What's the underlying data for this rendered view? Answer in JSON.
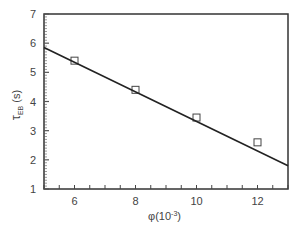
{
  "chart_data": {
    "type": "scatter",
    "title": "",
    "xlabel": "φ (10⁻³)",
    "ylabel": "τEB (s)",
    "xlim": [
      5,
      13
    ],
    "ylim": [
      1,
      7
    ],
    "xticks": [
      6,
      8,
      10,
      12
    ],
    "yticks": [
      1,
      2,
      3,
      4,
      5,
      6,
      7
    ],
    "grid": false,
    "series": [
      {
        "name": "data",
        "marker": "open-square",
        "x": [
          6,
          8,
          10,
          12
        ],
        "y": [
          5.4,
          4.4,
          3.45,
          2.6
        ]
      },
      {
        "name": "linear fit",
        "type": "line",
        "x": [
          5,
          13
        ],
        "y": [
          5.85,
          1.8
        ]
      }
    ]
  },
  "labels": {
    "x_main": "φ",
    "x_unit": "(10",
    "x_exp": "-3",
    "x_close": ")",
    "y_main": "τ",
    "y_sub": "EB",
    "y_unit": " (s)"
  }
}
